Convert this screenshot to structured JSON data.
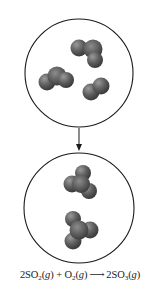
{
  "diagram": {
    "type": "reaction-particle-diagram",
    "colors": {
      "circle_stroke": "#1a1a1a",
      "atom_dark": "#3a3a3a",
      "atom_mid": "#6a6a6a",
      "atom_light": "#9a9a9a",
      "arrow": "#1a1a1a",
      "text": "#222222"
    },
    "reactants_panel": {
      "label": "reactants",
      "molecules": [
        {
          "formula": "SO2",
          "count": 2
        },
        {
          "formula": "O2",
          "count": 1
        }
      ]
    },
    "products_panel": {
      "label": "products",
      "molecules": [
        {
          "formula": "SO3",
          "count": 2
        }
      ]
    },
    "transition_arrow": "down-arrow"
  },
  "equation": {
    "coef1": "2",
    "species1": "SO",
    "sub1": "2",
    "phase1_open": "(",
    "phase1": "g",
    "phase1_close": ")",
    "plus": " + ",
    "species2": "O",
    "sub2": "2",
    "phase2_open": "(",
    "phase2": "g",
    "phase2_close": ")",
    "arrow": "⟶",
    "coef3": "2",
    "species3": "SO",
    "sub3": "3",
    "phase3_open": "(",
    "phase3": "g",
    "phase3_close": ")"
  }
}
